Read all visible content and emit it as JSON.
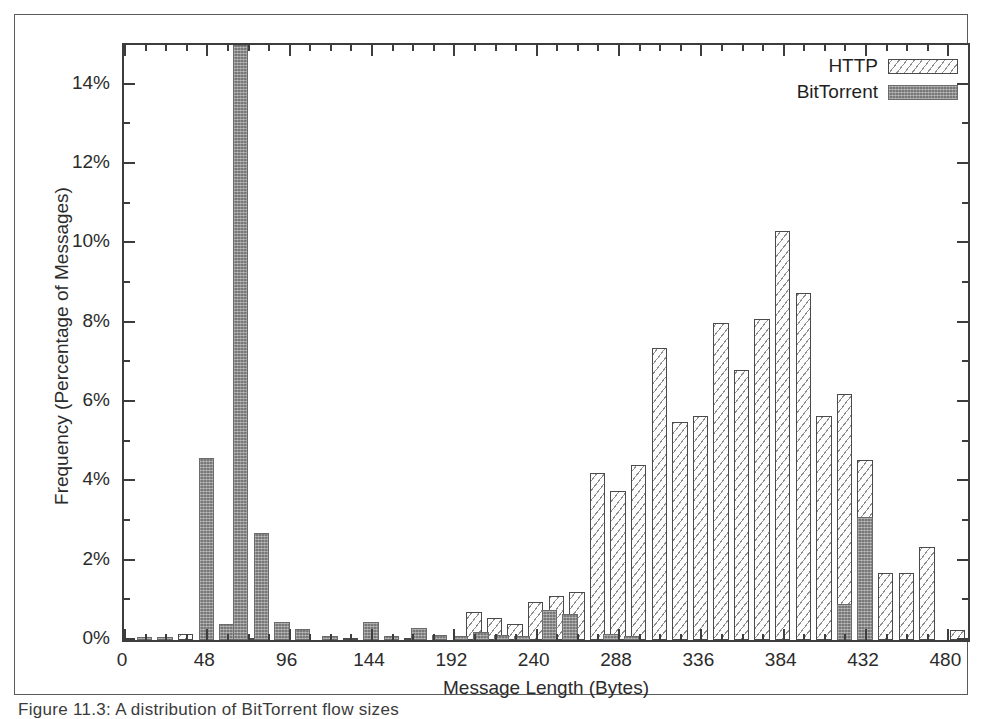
{
  "figure": {
    "caption": "Figure 11.3: A distribution of BitTorrent flow sizes"
  },
  "chart_data": {
    "type": "bar",
    "title": "",
    "xlabel": "Message Length (Bytes)",
    "ylabel": "Frequency (Percentage of Messages)",
    "xlim": [
      0,
      492
    ],
    "ylim": [
      0,
      15
    ],
    "xticks": [
      0,
      48,
      96,
      144,
      192,
      240,
      288,
      336,
      384,
      432,
      480
    ],
    "xtick_labels": [
      "0",
      "48",
      "96",
      "144",
      "192",
      "240",
      "288",
      "336",
      "384",
      "432",
      "480"
    ],
    "xtick_minor_step": 12,
    "yticks": [
      0,
      2,
      4,
      6,
      8,
      10,
      12,
      14
    ],
    "ytick_labels": [
      "0%",
      "2%",
      "4%",
      "6%",
      "8%",
      "10%",
      "12%",
      "14%"
    ],
    "ytick_minor_step": 1,
    "grid": false,
    "legend_position": "top-right",
    "bar_width_units": 9,
    "series": [
      {
        "name": "HTTP",
        "style": "hatched",
        "color": "#fdfdfd",
        "points": [
          {
            "x": 36,
            "y": 0.15
          },
          {
            "x": 72,
            "y": 0.05
          },
          {
            "x": 132,
            "y": 0.05
          },
          {
            "x": 168,
            "y": 0.05
          },
          {
            "x": 204,
            "y": 0.7
          },
          {
            "x": 216,
            "y": 0.55
          },
          {
            "x": 228,
            "y": 0.4
          },
          {
            "x": 240,
            "y": 0.95
          },
          {
            "x": 252,
            "y": 1.1
          },
          {
            "x": 264,
            "y": 1.2
          },
          {
            "x": 276,
            "y": 4.2
          },
          {
            "x": 288,
            "y": 3.75
          },
          {
            "x": 300,
            "y": 4.4
          },
          {
            "x": 312,
            "y": 7.35
          },
          {
            "x": 324,
            "y": 5.5
          },
          {
            "x": 336,
            "y": 5.65
          },
          {
            "x": 348,
            "y": 8.0
          },
          {
            "x": 360,
            "y": 6.8
          },
          {
            "x": 372,
            "y": 8.1
          },
          {
            "x": 384,
            "y": 10.3
          },
          {
            "x": 396,
            "y": 8.75
          },
          {
            "x": 408,
            "y": 5.65
          },
          {
            "x": 420,
            "y": 6.2
          },
          {
            "x": 432,
            "y": 4.55
          },
          {
            "x": 444,
            "y": 1.7
          },
          {
            "x": 456,
            "y": 1.7
          },
          {
            "x": 468,
            "y": 2.35
          },
          {
            "x": 486,
            "y": 0.25
          }
        ]
      },
      {
        "name": "BitTorrent",
        "style": "solid",
        "color": "#787878",
        "points": [
          {
            "x": 12,
            "y": 0.08
          },
          {
            "x": 24,
            "y": 0.08
          },
          {
            "x": 48,
            "y": 4.6
          },
          {
            "x": 60,
            "y": 0.4
          },
          {
            "x": 68,
            "y": 15.0
          },
          {
            "x": 80,
            "y": 2.7
          },
          {
            "x": 92,
            "y": 0.45
          },
          {
            "x": 104,
            "y": 0.28
          },
          {
            "x": 120,
            "y": 0.1
          },
          {
            "x": 144,
            "y": 0.45
          },
          {
            "x": 156,
            "y": 0.1
          },
          {
            "x": 172,
            "y": 0.3
          },
          {
            "x": 184,
            "y": 0.12
          },
          {
            "x": 196,
            "y": 0.1
          },
          {
            "x": 208,
            "y": 0.2
          },
          {
            "x": 220,
            "y": 0.12
          },
          {
            "x": 232,
            "y": 0.1
          },
          {
            "x": 248,
            "y": 0.75
          },
          {
            "x": 260,
            "y": 0.65
          },
          {
            "x": 284,
            "y": 0.15
          },
          {
            "x": 296,
            "y": 0.1
          },
          {
            "x": 420,
            "y": 0.9
          },
          {
            "x": 432,
            "y": 3.1
          }
        ]
      }
    ]
  },
  "legend": {
    "entries": [
      {
        "label": "HTTP",
        "swatch": "hatched-box"
      },
      {
        "label": "BitTorrent",
        "swatch": "solid-gray-box"
      }
    ]
  }
}
